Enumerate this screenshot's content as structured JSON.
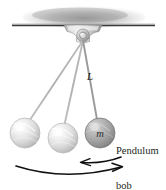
{
  "figure": {
    "kind": "physics-illustration",
    "width": 166,
    "height": 190,
    "background_color": "#ffffff"
  },
  "labels": {
    "length": "L",
    "mass": "m",
    "bob_caption_line1": "Pendulum",
    "bob_caption_line2": "bob"
  },
  "colors": {
    "ink": "#231f20",
    "ceiling_line": "#3a3a3a",
    "ceiling_shadow": "#9a9a9a",
    "bracket_light": "#f2f2f2",
    "bracket_mid": "#c9c9c9",
    "bracket_dark": "#8e8e8e",
    "string": "#b5b5b5",
    "bob_light": "#e8e8e8",
    "bob_light_edge": "#b9b9b9",
    "bob_dark": "#9d9d9d",
    "bob_dark_edge": "#6f6f6f",
    "arrow": "#111111"
  },
  "geometry": {
    "ceiling": {
      "x1": 12,
      "x2": 155,
      "y": 25
    },
    "ceiling_shadow": {
      "cx": 84,
      "cy": 17,
      "rx": 62,
      "ry": 11
    },
    "pivot": {
      "cx": 83,
      "cy": 35,
      "r": 5
    },
    "bracket": {
      "x_left": 63,
      "x_right": 103,
      "y_top": 25,
      "y_bottom": 41
    },
    "bobs": [
      {
        "id": "bob-left",
        "cx": 25,
        "cy": 133,
        "r": 15,
        "shade": "light",
        "label": ""
      },
      {
        "id": "bob-middle",
        "cx": 63,
        "cy": 138,
        "r": 15,
        "shade": "light",
        "label": ""
      },
      {
        "id": "bob-right",
        "cx": 100,
        "cy": 133,
        "r": 15,
        "shade": "dark",
        "label": "m"
      }
    ],
    "strings": [
      {
        "id": "string-left",
        "x1": 83,
        "y1": 40,
        "x2": 29,
        "y2": 120
      },
      {
        "id": "string-middle",
        "x1": 83,
        "y1": 40,
        "x2": 64,
        "y2": 124
      },
      {
        "id": "string-right",
        "x1": 83,
        "y1": 40,
        "x2": 97,
        "y2": 120
      }
    ],
    "arrows": [
      {
        "id": "swing-arrow-right",
        "direction": "right",
        "description": "long lower arc sweeping right"
      },
      {
        "id": "swing-arrow-left",
        "direction": "left",
        "description": "short upper arc sweeping left"
      }
    ]
  }
}
